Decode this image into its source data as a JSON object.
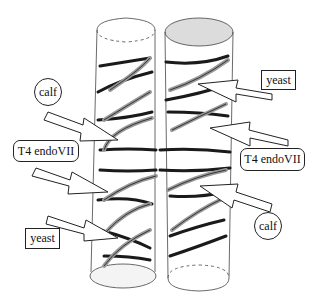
{
  "figure": {
    "colors": {
      "stroke": "#222222",
      "strand_dark": "#1a1a1a",
      "strand_light": "#bbbbbb",
      "shaded_cap": "#dcdcdc",
      "background": "#ffffff"
    }
  },
  "labels": {
    "left_calf": "calf",
    "left_t4": "T4 endoVII",
    "left_yeast": "yeast",
    "right_yeast": "yeast",
    "right_t4": "T4 endoVII",
    "right_calf": "calf"
  }
}
